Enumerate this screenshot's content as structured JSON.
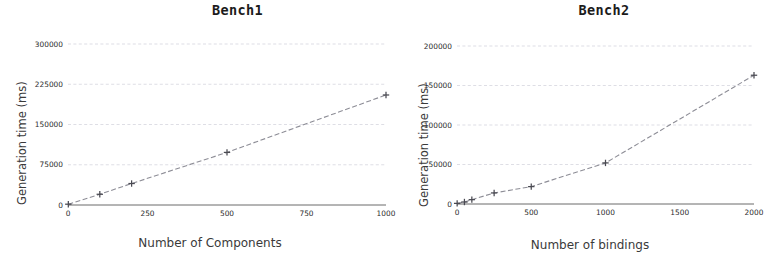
{
  "figure": {
    "background_color": "#ffffff",
    "panels": [
      "Bench1",
      "Bench2"
    ]
  },
  "chart_data": [
    {
      "type": "line",
      "title": "Bench1",
      "xlabel": "Number of Components",
      "ylabel": "Generation time (ms)",
      "x": [
        1,
        100,
        200,
        500,
        1000
      ],
      "values": [
        1500,
        20000,
        40000,
        98000,
        205000
      ],
      "xlim": [
        0,
        1000
      ],
      "ylim": [
        0,
        300000
      ],
      "xticks": [
        0,
        250,
        500,
        750,
        1000
      ],
      "xtick_labels": [
        "0",
        "250",
        "500",
        "750",
        "1000"
      ],
      "yticks": [
        0,
        75000,
        150000,
        225000,
        300000
      ],
      "ytick_labels": [
        "0",
        "75000",
        "150000",
        "225000",
        "300000"
      ],
      "grid": true,
      "grid_axis": "y",
      "legend": false,
      "marker": "plus",
      "line_style": "dashed",
      "line_color": "#8d8d96",
      "marker_color": "#4a4a52",
      "grid_color": "#c9c9d4"
    },
    {
      "type": "line",
      "title": "Bench2",
      "xlabel": "Number of bindings",
      "ylabel": "Generation time (ms)",
      "x": [
        1,
        50,
        100,
        250,
        500,
        1000,
        2000
      ],
      "values": [
        800,
        2500,
        5500,
        14000,
        22000,
        52000,
        163000
      ],
      "xlim": [
        0,
        2000
      ],
      "ylim": [
        0,
        200000
      ],
      "xticks": [
        0,
        500,
        1000,
        1500,
        2000
      ],
      "xtick_labels": [
        "0",
        "500",
        "1000",
        "1500",
        "2000"
      ],
      "yticks": [
        0,
        50000,
        100000,
        150000,
        200000
      ],
      "ytick_labels": [
        "0",
        "50000",
        "100000",
        "150000",
        "200000"
      ],
      "grid": true,
      "grid_axis": "y",
      "legend": false,
      "marker": "plus",
      "line_style": "dashed",
      "line_color": "#8d8d96",
      "marker_color": "#4a4a52",
      "grid_color": "#c9c9d4"
    }
  ]
}
